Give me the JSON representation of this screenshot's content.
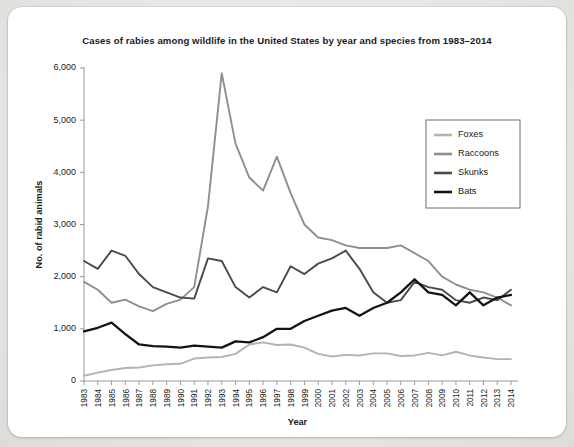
{
  "chart_data": {
    "type": "line",
    "title": "Cases of rabies among wildlife in the United States by year and species from 1983–2014",
    "xlabel": "Year",
    "ylabel": "No. of rabid animals",
    "grid": false,
    "legend_position": "top-right",
    "ylim": [
      0,
      6000
    ],
    "yticks": [
      "0",
      "1,000",
      "2,000",
      "3,000",
      "4,000",
      "5,000",
      "6,000"
    ],
    "ytick_values": [
      0,
      1000,
      2000,
      3000,
      4000,
      5000,
      6000
    ],
    "categories": [
      "1983",
      "1984",
      "1985",
      "1986",
      "1987",
      "1988",
      "1989",
      "1990",
      "1991",
      "1992",
      "1993",
      "1994",
      "1995",
      "1996",
      "1997",
      "1998",
      "1999",
      "2000",
      "2001",
      "2002",
      "2003",
      "2004",
      "2005",
      "2006",
      "2007",
      "2008",
      "2009",
      "2010",
      "2011",
      "2012",
      "2013",
      "2014"
    ],
    "series": [
      {
        "name": "Foxes",
        "color": "#b3b3b3",
        "values": [
          100,
          160,
          210,
          250,
          260,
          300,
          320,
          330,
          430,
          450,
          460,
          520,
          700,
          740,
          690,
          700,
          640,
          520,
          470,
          500,
          490,
          530,
          530,
          480,
          490,
          540,
          490,
          560,
          490,
          450,
          420,
          420
        ]
      },
      {
        "name": "Raccoons",
        "color": "#8f8f8f",
        "values": [
          1900,
          1750,
          1500,
          1560,
          1430,
          1340,
          1480,
          1560,
          1800,
          3350,
          5900,
          4550,
          3900,
          3650,
          4300,
          3600,
          3000,
          2750,
          2700,
          2600,
          2550,
          2550,
          2550,
          2600,
          2450,
          2300,
          2000,
          1850,
          1750,
          1700,
          1600,
          1450
        ]
      },
      {
        "name": "Skunks",
        "color": "#4a4a4a",
        "values": [
          2300,
          2150,
          2500,
          2400,
          2050,
          1800,
          1700,
          1600,
          1580,
          2350,
          2300,
          1800,
          1600,
          1800,
          1700,
          2200,
          2050,
          2250,
          2350,
          2500,
          2150,
          1700,
          1500,
          1550,
          1900,
          1800,
          1750,
          1550,
          1500,
          1600,
          1550,
          1750
        ]
      },
      {
        "name": "Bats",
        "color": "#141414",
        "values": [
          950,
          1020,
          1120,
          900,
          700,
          670,
          660,
          640,
          680,
          660,
          640,
          760,
          740,
          840,
          1000,
          1000,
          1150,
          1250,
          1350,
          1400,
          1250,
          1400,
          1500,
          1700,
          1950,
          1700,
          1650,
          1450,
          1700,
          1450,
          1600,
          1650
        ]
      }
    ]
  },
  "legend": {
    "entries": [
      {
        "label": "Foxes",
        "color": "#b3b3b3"
      },
      {
        "label": "Raccoons",
        "color": "#8f8f8f"
      },
      {
        "label": "Skunks",
        "color": "#4a4a4a"
      },
      {
        "label": "Bats",
        "color": "#141414"
      }
    ]
  }
}
